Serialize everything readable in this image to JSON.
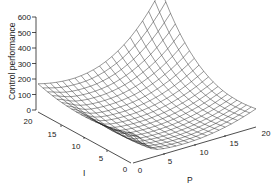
{
  "chart_data": {
    "type": "surface",
    "title": "",
    "xlabel": "P",
    "ylabel": "I",
    "zlabel": "Control performance",
    "x_ticks": [
      "0",
      "5",
      "10",
      "15",
      "20"
    ],
    "y_ticks": [
      "0",
      "5",
      "10",
      "15",
      "20"
    ],
    "z_ticks": [
      "0",
      "100",
      "200",
      "300",
      "400",
      "500",
      "600"
    ],
    "xlim": [
      0,
      20
    ],
    "ylim": [
      0,
      20
    ],
    "zlim": [
      0,
      600
    ],
    "grid": false,
    "legend": null,
    "corner_values": [
      {
        "P": 0,
        "I": 20,
        "value": 200
      },
      {
        "P": 20,
        "I": 20,
        "value": 550
      },
      {
        "P": 20,
        "I": 0,
        "value": 200
      },
      {
        "P": 0,
        "I": 0,
        "value": 90
      },
      {
        "P": 8,
        "I": 5,
        "value": 10
      }
    ]
  }
}
